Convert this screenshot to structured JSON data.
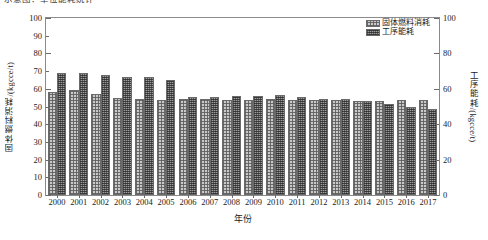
{
  "caption": "示意图：单位能耗统计",
  "chart_data": {
    "type": "bar",
    "title": "",
    "xlabel": "年份",
    "ylabel": "固体燃料消耗/(kgcce/t)",
    "ylabel_right": "工序能耗/(kgcce/t)",
    "ylim": [
      0,
      100
    ],
    "yticks": [
      0,
      10,
      20,
      30,
      40,
      50,
      60,
      70,
      80,
      90,
      100
    ],
    "ylim_right": [
      0,
      100
    ],
    "yticks_right": [
      0,
      20,
      40,
      60,
      80,
      100
    ],
    "grid": false,
    "legend_position": "top-right",
    "categories": [
      "2000",
      "2001",
      "2002",
      "2003",
      "2004",
      "2005",
      "2006",
      "2007",
      "2008",
      "2009",
      "2010",
      "2011",
      "2012",
      "2013",
      "2014",
      "2015",
      "2016",
      "2017"
    ],
    "series": [
      {
        "name": "固体燃料消耗",
        "axis": "left",
        "values": [
          58.0,
          59.5,
          57.0,
          55.0,
          54.0,
          53.5,
          54.0,
          54.0,
          53.5,
          53.5,
          54.0,
          53.5,
          53.5,
          53.5,
          53.0,
          53.0,
          53.5,
          53.5
        ]
      },
      {
        "name": "工序能耗",
        "axis": "right",
        "values": [
          69.0,
          69.0,
          68.0,
          66.5,
          66.5,
          65.0,
          55.5,
          55.5,
          56.0,
          56.0,
          56.5,
          55.5,
          54.5,
          54.0,
          53.0,
          51.5,
          50.0,
          48.5
        ]
      }
    ]
  },
  "colors": {
    "series1": "#c9c9c9",
    "series2": "#9d9d9d",
    "frame": "#8a8a8a",
    "text": "#1a1a1a"
  }
}
